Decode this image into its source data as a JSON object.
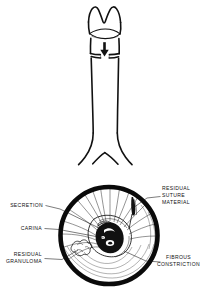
{
  "figure": {
    "title": "",
    "ink_color": "#111111",
    "background_color": "#ffffff",
    "upper_panel": {
      "name": "trachea-anterior-view",
      "arrow_icon": "down-arrow-icon",
      "description_parts": [
        "larynx",
        "vocal-cords",
        "tracheal-stenosis-band",
        "trachea",
        "carina-bifurcation"
      ]
    },
    "lower_panel": {
      "name": "bronchoscopic-circular-view",
      "ring_color": "#0a0a0a"
    },
    "labels": {
      "secretion": {
        "lines": [
          "SECRETION"
        ],
        "side": "left"
      },
      "carina": {
        "lines": [
          "CARINA"
        ],
        "side": "left"
      },
      "residual_granuloma": {
        "lines": [
          "RESIDUAL",
          "GRANULOMA"
        ],
        "side": "left"
      },
      "residual_suture_material": {
        "lines": [
          "RESIDUAL",
          "SUTURE",
          "MATERIAL"
        ],
        "side": "right"
      },
      "fibrous_constriction": {
        "lines": [
          "FIBROUS",
          "CONSTRICTION"
        ],
        "side": "right"
      }
    }
  }
}
